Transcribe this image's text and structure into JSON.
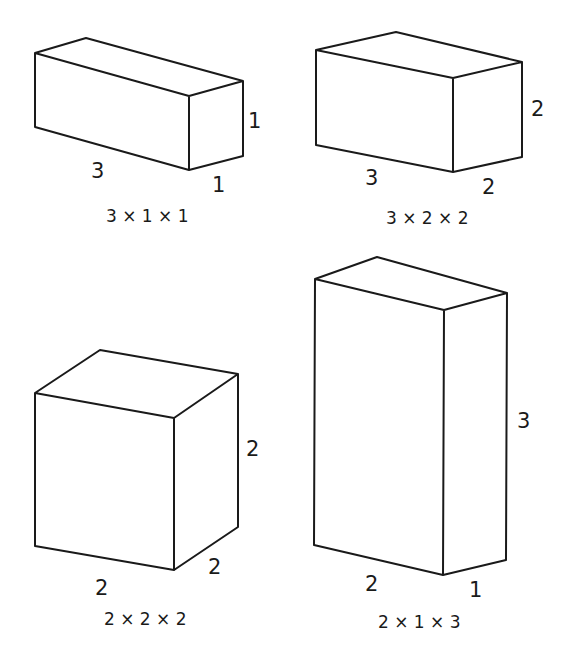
{
  "diagram": {
    "title": "",
    "boxes": [
      {
        "id": "box-3x1x1",
        "caption": "3 × 1 × 1",
        "dims": {
          "length": 3,
          "width": 1,
          "height": 1
        },
        "labels": {
          "length": "3",
          "depth": "1",
          "height": "1"
        },
        "vertices": {
          "ftl": [
            35,
            53
          ],
          "btl": [
            86,
            38
          ],
          "btr": [
            243,
            81
          ],
          "ftr": [
            189,
            96
          ],
          "fbl": [
            35,
            127
          ],
          "fbr": [
            189,
            170
          ],
          "bbr": [
            243,
            156
          ]
        }
      },
      {
        "id": "box-3x2x2",
        "caption": "3 × 2 × 2",
        "dims": {
          "length": 3,
          "width": 2,
          "height": 2
        },
        "labels": {
          "length": "3",
          "depth": "2",
          "height": "2"
        },
        "vertices": {
          "ftl": [
            316,
            50
          ],
          "btl": [
            396,
            32
          ],
          "btr": [
            522,
            62
          ],
          "ftr": [
            453,
            78
          ],
          "fbl": [
            316,
            145
          ],
          "fbr": [
            453,
            172
          ],
          "bbr": [
            522,
            157
          ]
        }
      },
      {
        "id": "box-2x2x2",
        "caption": "2 × 2 × 2",
        "dims": {
          "length": 2,
          "width": 2,
          "height": 2
        },
        "labels": {
          "length": "2",
          "depth": "2",
          "height": "2"
        },
        "vertices": {
          "ftl": [
            35,
            393
          ],
          "btl": [
            100,
            350
          ],
          "btr": [
            238,
            374
          ],
          "ftr": [
            174,
            418
          ],
          "fbl": [
            35,
            546
          ],
          "fbr": [
            174,
            570
          ],
          "bbr": [
            238,
            527
          ]
        }
      },
      {
        "id": "box-2x1x3",
        "caption": "2 × 1 × 3",
        "dims": {
          "length": 2,
          "width": 1,
          "height": 3
        },
        "labels": {
          "length": "2",
          "depth": "1",
          "height": "3"
        },
        "vertices": {
          "ftl": [
            315,
            279
          ],
          "btl": [
            377,
            257
          ],
          "btr": [
            507,
            293
          ],
          "ftr": [
            444,
            310
          ],
          "fbl": [
            314,
            545
          ],
          "fbr": [
            443,
            575
          ],
          "bbr": [
            506,
            560
          ]
        }
      }
    ],
    "colors": {
      "stroke": "#1a1a1a",
      "background": "#ffffff"
    }
  }
}
